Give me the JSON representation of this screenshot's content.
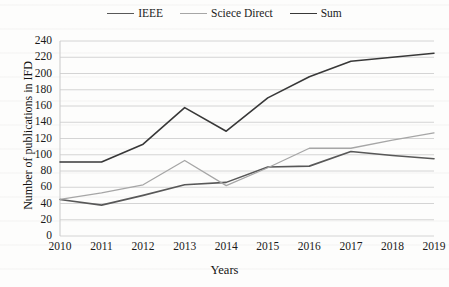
{
  "chart_data": {
    "type": "line",
    "title": "",
    "xlabel": "Years",
    "ylabel": "Number of publications in IFD",
    "categories": [
      "2010",
      "2011",
      "2012",
      "2013",
      "2014",
      "2015",
      "2016",
      "2017",
      "2018",
      "2019"
    ],
    "x": [
      2010,
      2011,
      2012,
      2013,
      2014,
      2015,
      2016,
      2017,
      2018,
      2019
    ],
    "ylim": [
      0,
      240
    ],
    "yticks": [
      0,
      20,
      40,
      60,
      80,
      100,
      120,
      140,
      160,
      180,
      200,
      220,
      240
    ],
    "grid": "horizontal",
    "legend_position": "top-center",
    "series": [
      {
        "name": "IEEE",
        "color": "#585858",
        "values": [
          45,
          38,
          50,
          63,
          66,
          85,
          86,
          104,
          99,
          95
        ]
      },
      {
        "name": "Sciece Direct",
        "color": "#a6a6a6",
        "values": [
          45,
          53,
          63,
          93,
          62,
          84,
          108,
          108,
          118,
          127
        ]
      },
      {
        "name": "Sum",
        "color": "#383838",
        "values": [
          91,
          91,
          113,
          158,
          129,
          170,
          196,
          215,
          220,
          225
        ]
      }
    ]
  },
  "axes": {
    "y_title": "Number of publications in IFD",
    "x_title": "Years",
    "y_tick_labels": [
      "240",
      "220",
      "200",
      "180",
      "160",
      "140",
      "120",
      "100",
      "80",
      "60",
      "40",
      "20",
      "0"
    ],
    "x_tick_labels": [
      "2010",
      "2011",
      "2012",
      "2013",
      "2014",
      "2015",
      "2016",
      "2017",
      "2018",
      "2019"
    ]
  },
  "legend": {
    "items": [
      {
        "label": "IEEE",
        "color": "#585858"
      },
      {
        "label": "Sciece Direct",
        "color": "#a6a6a6"
      },
      {
        "label": "Sum",
        "color": "#383838"
      }
    ]
  },
  "style": {
    "gridline_color": "#d4d4d4",
    "axis_color": "#c9c9c9",
    "text_color": "#1a1a1a",
    "background": "#fdfdfc"
  }
}
